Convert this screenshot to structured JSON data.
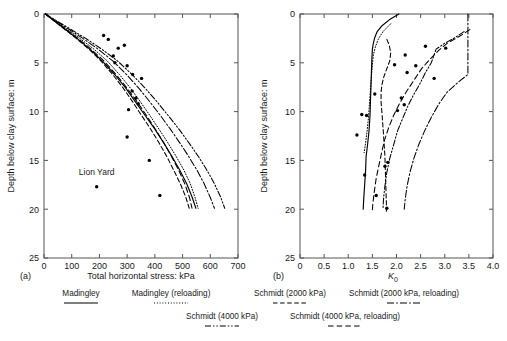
{
  "figure": {
    "panels": [
      {
        "tag": "(a)",
        "xlabel": "Total horizontal stress: kPa",
        "ylabel": "Depth below clay surface: m",
        "annotation": "Lion Yard"
      },
      {
        "tag": "(b)",
        "xlabel": "K",
        "xlabel_sub": "0",
        "ylabel": "Depth below clay surface: m"
      }
    ]
  },
  "legend": {
    "row1": [
      {
        "label": "Madingley",
        "style": "solid"
      },
      {
        "label": "Madingley (reloading)",
        "style": "dotted"
      },
      {
        "label": "Schmidt (2000 kPa)",
        "style": "dashed"
      },
      {
        "label": "Schmidt (2000 kPa, reloading)",
        "style": "dashdot"
      }
    ],
    "row2": [
      {
        "label": "Schmidt (4000 kPa)",
        "style": "dashdotdot"
      },
      {
        "label": "Schmidt (4000 kPa, reloading)",
        "style": "longdash"
      }
    ]
  },
  "chart_data": [
    {
      "type": "line",
      "title": "",
      "panel": "(a)",
      "xlabel": "Total horizontal stress: kPa",
      "ylabel": "Depth below clay surface: m",
      "xlim": [
        0,
        700
      ],
      "ylim": [
        0,
        25
      ],
      "y_inverted": true,
      "xticks": [
        0,
        100,
        200,
        300,
        400,
        500,
        600,
        700
      ],
      "yticks": [
        0,
        5,
        10,
        15,
        20,
        25
      ],
      "grid": false,
      "legend_position": "below-figure",
      "annotations": [
        {
          "text": "Lion Yard",
          "x": 190,
          "y": 16.5
        }
      ],
      "series": [
        {
          "name": "Madingley",
          "style": "solid",
          "points": [
            [
              5,
              0
            ],
            [
              60,
              1.2
            ],
            [
              115,
              2.4
            ],
            [
              165,
              3.6
            ],
            [
              210,
              4.8
            ],
            [
              255,
              6.2
            ],
            [
              295,
              7.6
            ],
            [
              330,
              9.0
            ],
            [
              365,
              10.4
            ],
            [
              400,
              11.8
            ],
            [
              432,
              13.2
            ],
            [
              462,
              14.6
            ],
            [
              490,
              16.0
            ],
            [
              515,
              17.4
            ],
            [
              535,
              18.8
            ],
            [
              548,
              19.9
            ]
          ]
        },
        {
          "name": "Madingley (reloading)",
          "style": "dotted",
          "points": [
            [
              5,
              0
            ],
            [
              65,
              1.2
            ],
            [
              125,
              2.4
            ],
            [
              180,
              3.6
            ],
            [
              228,
              4.8
            ],
            [
              272,
              6.2
            ],
            [
              312,
              7.6
            ],
            [
              348,
              9.0
            ],
            [
              382,
              10.4
            ],
            [
              415,
              11.8
            ],
            [
              447,
              13.2
            ],
            [
              477,
              14.6
            ],
            [
              505,
              16.0
            ],
            [
              528,
              17.4
            ],
            [
              545,
              18.8
            ],
            [
              556,
              19.9
            ]
          ]
        },
        {
          "name": "Schmidt (2000 kPa)",
          "style": "dashed",
          "points": [
            [
              5,
              0
            ],
            [
              58,
              1.2
            ],
            [
              112,
              2.4
            ],
            [
              162,
              3.6
            ],
            [
              205,
              4.8
            ],
            [
              248,
              6.2
            ],
            [
              286,
              7.6
            ],
            [
              320,
              9.0
            ],
            [
              352,
              10.4
            ],
            [
              385,
              11.8
            ],
            [
              415,
              13.2
            ],
            [
              443,
              14.6
            ],
            [
              468,
              16.0
            ],
            [
              492,
              17.4
            ],
            [
              512,
              18.8
            ],
            [
              524,
              19.9
            ]
          ]
        },
        {
          "name": "Schmidt (2000 kPa, reloading)",
          "style": "dashdot",
          "points": [
            [
              5,
              0
            ],
            [
              70,
              1.2
            ],
            [
              135,
              2.4
            ],
            [
              195,
              3.6
            ],
            [
              248,
              4.8
            ],
            [
              298,
              6.2
            ],
            [
              342,
              7.6
            ],
            [
              382,
              9.0
            ],
            [
              420,
              10.4
            ],
            [
              456,
              11.8
            ],
            [
              490,
              13.2
            ],
            [
              522,
              14.6
            ],
            [
              552,
              16.0
            ],
            [
              578,
              17.4
            ],
            [
              600,
              18.8
            ],
            [
              615,
              19.9
            ]
          ]
        },
        {
          "name": "Schmidt (4000 kPa)",
          "style": "dashdotdot",
          "points": [
            [
              5,
              0
            ],
            [
              75,
              1.2
            ],
            [
              145,
              2.4
            ],
            [
              208,
              3.6
            ],
            [
              265,
              4.8
            ],
            [
              318,
              6.2
            ],
            [
              365,
              7.6
            ],
            [
              408,
              9.0
            ],
            [
              448,
              10.4
            ],
            [
              487,
              11.8
            ],
            [
              523,
              13.2
            ],
            [
              557,
              14.6
            ],
            [
              588,
              16.0
            ],
            [
              615,
              17.4
            ],
            [
              638,
              18.8
            ],
            [
              652,
              19.9
            ]
          ]
        },
        {
          "name": "Schmidt (4000 kPa, reloading)",
          "style": "longdash",
          "points": [
            [
              5,
              0
            ],
            [
              62,
              1.2
            ],
            [
              118,
              2.4
            ],
            [
              170,
              3.6
            ],
            [
              216,
              4.8
            ],
            [
              260,
              6.2
            ],
            [
              300,
              7.6
            ],
            [
              336,
              9.0
            ],
            [
              370,
              10.4
            ],
            [
              402,
              11.8
            ],
            [
              432,
              13.2
            ],
            [
              460,
              14.6
            ],
            [
              486,
              16.0
            ],
            [
              508,
              17.4
            ],
            [
              525,
              18.8
            ],
            [
              534,
              19.9
            ]
          ]
        }
      ],
      "scatter": {
        "name": "Lion Yard measurements",
        "marker": "filled-circle",
        "points": [
          [
            215,
            2.2
          ],
          [
            232,
            2.6
          ],
          [
            268,
            3.5
          ],
          [
            290,
            3.2
          ],
          [
            250,
            4.3
          ],
          [
            256,
            5.0
          ],
          [
            300,
            5.3
          ],
          [
            320,
            6.2
          ],
          [
            352,
            6.6
          ],
          [
            318,
            7.9
          ],
          [
            332,
            8.6
          ],
          [
            340,
            9.2
          ],
          [
            305,
            9.8
          ],
          [
            300,
            12.6
          ],
          [
            190,
            17.7
          ],
          [
            380,
            15.0
          ],
          [
            418,
            18.6
          ]
        ]
      }
    },
    {
      "type": "line",
      "title": "",
      "panel": "(b)",
      "xlabel": "K0",
      "ylabel": "Depth below clay surface: m",
      "xlim": [
        0,
        4.0
      ],
      "ylim": [
        0,
        25
      ],
      "y_inverted": true,
      "xticks": [
        0,
        0.5,
        1.0,
        1.5,
        2.0,
        2.5,
        3.0,
        3.5,
        4.0
      ],
      "yticks": [
        0,
        5,
        10,
        15,
        20,
        25
      ],
      "grid": false,
      "legend_position": "below-figure",
      "series": [
        {
          "name": "Madingley",
          "style": "solid",
          "points": [
            [
              2.05,
              0.0
            ],
            [
              1.85,
              0.6
            ],
            [
              1.7,
              1.2
            ],
            [
              1.6,
              1.8
            ],
            [
              1.55,
              2.4
            ],
            [
              1.52,
              3.0
            ],
            [
              1.5,
              3.6
            ],
            [
              1.49,
              4.6
            ],
            [
              1.48,
              6.0
            ],
            [
              1.47,
              7.5
            ],
            [
              1.46,
              9.0
            ],
            [
              1.45,
              10.5
            ],
            [
              1.43,
              12.0
            ],
            [
              1.4,
              13.4
            ],
            [
              1.37,
              14.6
            ],
            [
              1.36,
              16.0
            ],
            [
              1.34,
              17.5
            ],
            [
              1.32,
              19.0
            ],
            [
              1.31,
              20.0
            ]
          ]
        },
        {
          "name": "Madingley (reloading)",
          "style": "dotted",
          "points": [
            [
              1.88,
              1.0
            ],
            [
              1.72,
              1.8
            ],
            [
              1.62,
              2.6
            ],
            [
              1.56,
              3.4
            ],
            [
              1.52,
              4.2
            ],
            [
              1.5,
              5.2
            ],
            [
              1.48,
              6.4
            ],
            [
              1.46,
              7.8
            ],
            [
              1.44,
              9.2
            ],
            [
              1.42,
              10.6
            ],
            [
              1.39,
              12.0
            ],
            [
              1.36,
              13.2
            ],
            [
              1.33,
              14.2
            ]
          ]
        },
        {
          "name": "Schmidt (2000 kPa)",
          "style": "dashed",
          "points": [
            [
              1.8,
              2.6
            ],
            [
              1.85,
              3.2
            ],
            [
              1.88,
              4.0
            ],
            [
              1.86,
              4.8
            ],
            [
              1.8,
              5.6
            ],
            [
              1.74,
              6.4
            ],
            [
              1.7,
              7.2
            ],
            [
              1.68,
              8.0
            ],
            [
              1.68,
              9.0
            ],
            [
              1.7,
              10.2
            ],
            [
              1.72,
              11.6
            ],
            [
              1.74,
              13.0
            ],
            [
              1.76,
              14.6
            ],
            [
              1.77,
              16.2
            ],
            [
              1.78,
              17.8
            ],
            [
              1.79,
              19.4
            ],
            [
              1.79,
              20.2
            ]
          ]
        },
        {
          "name": "Schmidt (2000 kPa, reloading)",
          "style": "dashdot",
          "points": [
            [
              3.48,
              0.0
            ],
            [
              3.48,
              1.0
            ],
            [
              3.48,
              2.0
            ],
            [
              3.48,
              3.0
            ],
            [
              3.48,
              4.0
            ],
            [
              3.48,
              5.0
            ],
            [
              3.48,
              6.2
            ],
            [
              3.3,
              6.9
            ],
            [
              3.05,
              8.0
            ],
            [
              2.88,
              9.2
            ],
            [
              2.72,
              10.6
            ],
            [
              2.58,
              12.0
            ],
            [
              2.46,
              13.4
            ],
            [
              2.36,
              14.8
            ],
            [
              2.28,
              16.2
            ],
            [
              2.22,
              17.6
            ],
            [
              2.18,
              19.0
            ],
            [
              2.16,
              20.0
            ]
          ]
        },
        {
          "name": "Schmidt (4000 kPa)",
          "style": "dashdotdot",
          "points": [
            [
              3.4,
              1.8
            ],
            [
              3.22,
              2.4
            ],
            [
              3.0,
              3.0
            ],
            [
              2.82,
              3.6
            ],
            [
              2.78,
              4.2
            ],
            [
              2.72,
              5.0
            ],
            [
              2.6,
              6.0
            ],
            [
              2.48,
              7.2
            ],
            [
              2.34,
              8.4
            ],
            [
              2.22,
              9.6
            ],
            [
              2.12,
              10.8
            ],
            [
              2.02,
              12.0
            ],
            [
              1.94,
              13.4
            ],
            [
              1.86,
              14.8
            ],
            [
              1.8,
              16.2
            ],
            [
              1.76,
              17.6
            ],
            [
              1.73,
              19.0
            ],
            [
              1.72,
              20.0
            ]
          ]
        },
        {
          "name": "Schmidt (4000 kPa, reloading)",
          "style": "longdash",
          "points": [
            [
              3.52,
              1.6
            ],
            [
              3.3,
              2.3
            ],
            [
              3.05,
              3.0
            ],
            [
              2.88,
              3.7
            ],
            [
              2.7,
              4.6
            ],
            [
              2.52,
              5.6
            ],
            [
              2.36,
              6.8
            ],
            [
              2.2,
              8.0
            ],
            [
              2.06,
              9.2
            ],
            [
              1.94,
              10.4
            ],
            [
              1.84,
              11.6
            ],
            [
              1.76,
              12.8
            ],
            [
              1.7,
              14.0
            ],
            [
              1.64,
              15.4
            ],
            [
              1.58,
              16.8
            ],
            [
              1.54,
              18.2
            ],
            [
              1.51,
              19.4
            ],
            [
              1.5,
              20.1
            ]
          ]
        }
      ],
      "scatter": {
        "name": "Lion Yard measurements",
        "marker": "filled-circle",
        "points": [
          [
            2.6,
            3.3
          ],
          [
            3.02,
            3.5
          ],
          [
            2.18,
            4.2
          ],
          [
            1.96,
            5.2
          ],
          [
            2.4,
            5.3
          ],
          [
            2.22,
            6.0
          ],
          [
            2.78,
            6.6
          ],
          [
            1.55,
            8.2
          ],
          [
            2.1,
            8.6
          ],
          [
            2.16,
            9.3
          ],
          [
            2.02,
            9.9
          ],
          [
            1.28,
            10.3
          ],
          [
            1.38,
            10.4
          ],
          [
            1.18,
            12.4
          ],
          [
            1.82,
            15.2
          ],
          [
            1.76,
            15.6
          ],
          [
            1.34,
            16.5
          ],
          [
            1.58,
            18.6
          ],
          [
            1.8,
            19.9
          ]
        ]
      }
    }
  ]
}
